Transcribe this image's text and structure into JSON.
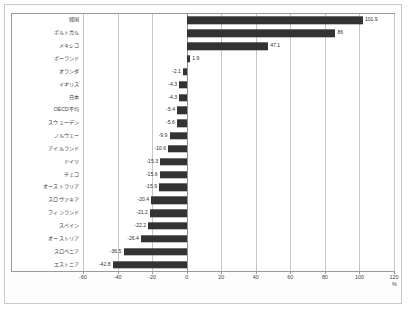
{
  "chart_data": {
    "type": "bar",
    "orientation": "horizontal",
    "title": "",
    "subtitle": "",
    "xlabel": "%",
    "ylabel": "",
    "xlim": [
      -60,
      120
    ],
    "xticks": [
      -60,
      -40,
      -20,
      0,
      20,
      40,
      60,
      80,
      100,
      120
    ],
    "xticklabels": [
      "-60",
      "-40",
      "-20",
      "0",
      "20",
      "40",
      "60",
      "80",
      "100",
      "120"
    ],
    "grid": true,
    "grid_axis": "x",
    "legend": false,
    "bar_color": "#333333",
    "categories": [
      "韓国",
      "ポルトガル",
      "メキシコ",
      "ポーランド",
      "オランダ",
      "イギリス",
      "日本",
      "OECD平均",
      "スウェーデン",
      "ノルウェー",
      "アイルランド",
      "ドイツ",
      "チェコ",
      "オーストラリア",
      "スロヴァキア",
      "フィンランド",
      "スペイン",
      "オーストリア",
      "スロベニア",
      "エストニア"
    ],
    "values": [
      101.9,
      86.0,
      47.1,
      1.9,
      -2.1,
      -4.3,
      -4.3,
      -5.4,
      -5.6,
      -9.9,
      -10.6,
      -15.3,
      -15.6,
      -15.9,
      -20.4,
      -21.2,
      -22.2,
      -26.4,
      -36.5,
      -42.8
    ],
    "value_labels": [
      "101.9",
      "86",
      "47.1",
      "1.9",
      "-2.1",
      "-4.3",
      "-4.3",
      "-5.4",
      "-5.6",
      "-9.9",
      "-10.6",
      "-15.3",
      "-15.6",
      "-15.9",
      "-20.4",
      "-21.2",
      "-22.2",
      "-26.4",
      "-36.5",
      "-42.8"
    ]
  }
}
